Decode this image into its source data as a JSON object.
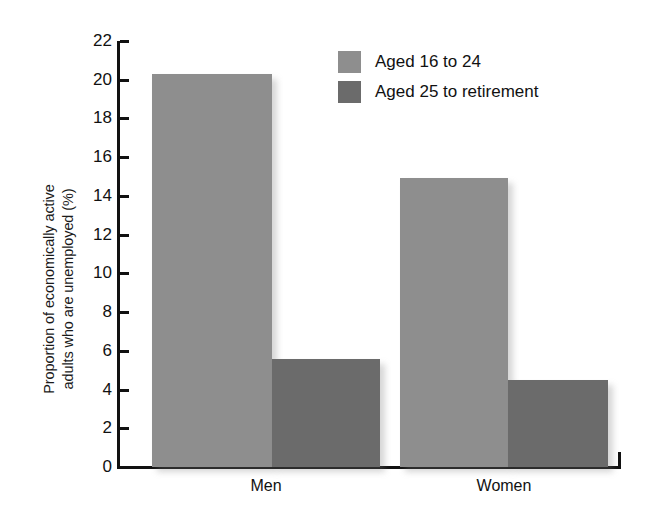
{
  "chart_data": {
    "type": "bar",
    "title": "",
    "subtitle": "",
    "xlabel": "",
    "ylabel": "Proportion of economically active adults who are unemployed (%)",
    "ylabel_lines": [
      "Proportion of economically active",
      "adults who are unemployed (%)"
    ],
    "categories": [
      "Men",
      "Women"
    ],
    "series": [
      {
        "name": "Aged 16 to 24",
        "values": [
          20.3,
          14.9
        ],
        "color": "#8e8e8e"
      },
      {
        "name": "Aged 25 to retirement",
        "values": [
          5.6,
          4.5
        ],
        "color": "#6b6b6b"
      }
    ],
    "ylim": [
      0,
      22
    ],
    "ytick_step": 2,
    "yticks": [
      "22",
      "20",
      "18",
      "16",
      "14",
      "12",
      "10",
      "8",
      "6",
      "4",
      "2",
      "0"
    ],
    "grid": false,
    "legend_position": "top-right",
    "annotations": []
  },
  "legend": {
    "entries": [
      {
        "label": "Aged 16 to 24",
        "color": "#8e8e8e"
      },
      {
        "label": "Aged 25 to retirement",
        "color": "#6b6b6b"
      }
    ]
  },
  "axis": {
    "y_title_line1": "Proportion of economically active",
    "y_title_line2": "adults who are unemployed (%)",
    "x_categories": [
      {
        "label": "Men"
      },
      {
        "label": "Women"
      }
    ]
  },
  "colors": {
    "light_gray_bar": "#8e8e8e",
    "dark_gray_bar": "#6b6b6b",
    "axis": "#111111",
    "background": "#ffffff"
  }
}
